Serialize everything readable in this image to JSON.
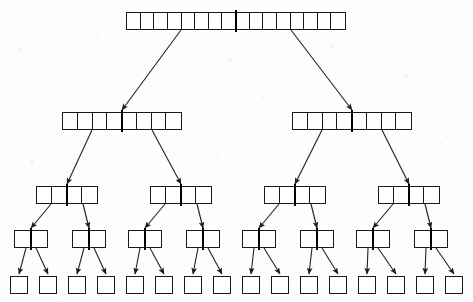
{
  "diagram": {
    "type": "tree-diagram",
    "canvas": {
      "width": 473,
      "height": 302,
      "background": "#fdfdfd"
    },
    "style": {
      "node_fill": "#ffffff",
      "node_stroke": "#1a1a1a",
      "divider_color": "#000000",
      "edge_color": "#222222",
      "edge_width": 1.1,
      "divider_width": 2.6
    },
    "levels": [
      {
        "index": 0,
        "label": "root",
        "cells": 16,
        "node_count": 1,
        "y": 12,
        "height": 18,
        "node_width": 220
      },
      {
        "index": 1,
        "label": "level-1",
        "cells": 8,
        "node_count": 2,
        "y": 112,
        "height": 18,
        "node_width": 120
      },
      {
        "index": 2,
        "label": "level-2",
        "cells": 4,
        "node_count": 4,
        "y": 186,
        "height": 18,
        "node_width": 62
      },
      {
        "index": 3,
        "label": "level-3",
        "cells": 2,
        "node_count": 8,
        "y": 230,
        "height": 18,
        "node_width": 34
      },
      {
        "index": 4,
        "label": "leaves",
        "cells": 1,
        "node_count": 16,
        "y": 276,
        "height": 18,
        "node_width": 18
      }
    ],
    "nodes": [
      {
        "id": "n0",
        "level": 0,
        "cells": 16,
        "x": 126,
        "y": 12,
        "w": 220,
        "h": 18,
        "divider": true
      },
      {
        "id": "n1L",
        "level": 1,
        "cells": 8,
        "x": 62,
        "y": 112,
        "w": 120,
        "h": 18,
        "divider": true
      },
      {
        "id": "n1R",
        "level": 1,
        "cells": 8,
        "x": 292,
        "y": 112,
        "w": 120,
        "h": 18,
        "divider": true
      },
      {
        "id": "n2a",
        "level": 2,
        "cells": 4,
        "x": 36,
        "y": 186,
        "w": 62,
        "h": 18,
        "divider": true
      },
      {
        "id": "n2b",
        "level": 2,
        "cells": 4,
        "x": 150,
        "y": 186,
        "w": 62,
        "h": 18,
        "divider": true
      },
      {
        "id": "n2c",
        "level": 2,
        "cells": 4,
        "x": 264,
        "y": 186,
        "w": 62,
        "h": 18,
        "divider": true
      },
      {
        "id": "n2d",
        "level": 2,
        "cells": 4,
        "x": 378,
        "y": 186,
        "w": 62,
        "h": 18,
        "divider": true
      },
      {
        "id": "n3a",
        "level": 3,
        "cells": 2,
        "x": 14,
        "y": 230,
        "w": 34,
        "h": 18,
        "divider": true
      },
      {
        "id": "n3b",
        "level": 3,
        "cells": 2,
        "x": 72,
        "y": 230,
        "w": 34,
        "h": 18,
        "divider": true
      },
      {
        "id": "n3c",
        "level": 3,
        "cells": 2,
        "x": 128,
        "y": 230,
        "w": 34,
        "h": 18,
        "divider": true
      },
      {
        "id": "n3d",
        "level": 3,
        "cells": 2,
        "x": 186,
        "y": 230,
        "w": 34,
        "h": 18,
        "divider": true
      },
      {
        "id": "n3e",
        "level": 3,
        "cells": 2,
        "x": 242,
        "y": 230,
        "w": 34,
        "h": 18,
        "divider": true
      },
      {
        "id": "n3f",
        "level": 3,
        "cells": 2,
        "x": 300,
        "y": 230,
        "w": 34,
        "h": 18,
        "divider": true
      },
      {
        "id": "n3g",
        "level": 3,
        "cells": 2,
        "x": 356,
        "y": 230,
        "w": 34,
        "h": 18,
        "divider": true
      },
      {
        "id": "n3h",
        "level": 3,
        "cells": 2,
        "x": 414,
        "y": 230,
        "w": 34,
        "h": 18,
        "divider": true
      },
      {
        "id": "l0",
        "level": 4,
        "cells": 1,
        "x": 10,
        "y": 276,
        "w": 18,
        "h": 18,
        "divider": false
      },
      {
        "id": "l1",
        "level": 4,
        "cells": 1,
        "x": 39,
        "y": 276,
        "w": 18,
        "h": 18,
        "divider": false
      },
      {
        "id": "l2",
        "level": 4,
        "cells": 1,
        "x": 68,
        "y": 276,
        "w": 18,
        "h": 18,
        "divider": false
      },
      {
        "id": "l3",
        "level": 4,
        "cells": 1,
        "x": 97,
        "y": 276,
        "w": 18,
        "h": 18,
        "divider": false
      },
      {
        "id": "l4",
        "level": 4,
        "cells": 1,
        "x": 126,
        "y": 276,
        "w": 18,
        "h": 18,
        "divider": false
      },
      {
        "id": "l5",
        "level": 4,
        "cells": 1,
        "x": 155,
        "y": 276,
        "w": 18,
        "h": 18,
        "divider": false
      },
      {
        "id": "l6",
        "level": 4,
        "cells": 1,
        "x": 184,
        "y": 276,
        "w": 18,
        "h": 18,
        "divider": false
      },
      {
        "id": "l7",
        "level": 4,
        "cells": 1,
        "x": 213,
        "y": 276,
        "w": 18,
        "h": 18,
        "divider": false
      },
      {
        "id": "l8",
        "level": 4,
        "cells": 1,
        "x": 242,
        "y": 276,
        "w": 18,
        "h": 18,
        "divider": false
      },
      {
        "id": "l9",
        "level": 4,
        "cells": 1,
        "x": 271,
        "y": 276,
        "w": 18,
        "h": 18,
        "divider": false
      },
      {
        "id": "l10",
        "level": 4,
        "cells": 1,
        "x": 300,
        "y": 276,
        "w": 18,
        "h": 18,
        "divider": false
      },
      {
        "id": "l11",
        "level": 4,
        "cells": 1,
        "x": 329,
        "y": 276,
        "w": 18,
        "h": 18,
        "divider": false
      },
      {
        "id": "l12",
        "level": 4,
        "cells": 1,
        "x": 358,
        "y": 276,
        "w": 18,
        "h": 18,
        "divider": false
      },
      {
        "id": "l13",
        "level": 4,
        "cells": 1,
        "x": 387,
        "y": 276,
        "w": 18,
        "h": 18,
        "divider": false
      },
      {
        "id": "l14",
        "level": 4,
        "cells": 1,
        "x": 416,
        "y": 276,
        "w": 18,
        "h": 18,
        "divider": false
      },
      {
        "id": "l15",
        "level": 4,
        "cells": 1,
        "x": 445,
        "y": 276,
        "w": 18,
        "h": 18,
        "divider": false
      }
    ],
    "edges": [
      {
        "from": "n0",
        "to": "n1L",
        "x1": 181,
        "y1": 30,
        "x2": 122,
        "y2": 110
      },
      {
        "from": "n0",
        "to": "n1R",
        "x1": 291,
        "y1": 30,
        "x2": 352,
        "y2": 110
      },
      {
        "from": "n1L",
        "to": "n2a",
        "x1": 92,
        "y1": 130,
        "x2": 67,
        "y2": 184
      },
      {
        "from": "n1L",
        "to": "n2b",
        "x1": 152,
        "y1": 130,
        "x2": 181,
        "y2": 184
      },
      {
        "from": "n1R",
        "to": "n2c",
        "x1": 322,
        "y1": 130,
        "x2": 295,
        "y2": 184
      },
      {
        "from": "n1R",
        "to": "n2d",
        "x1": 382,
        "y1": 130,
        "x2": 409,
        "y2": 184
      },
      {
        "from": "n2a",
        "to": "n3a",
        "x1": 51,
        "y1": 204,
        "x2": 31,
        "y2": 228
      },
      {
        "from": "n2a",
        "to": "n3b",
        "x1": 83,
        "y1": 204,
        "x2": 89,
        "y2": 228
      },
      {
        "from": "n2b",
        "to": "n3c",
        "x1": 165,
        "y1": 204,
        "x2": 145,
        "y2": 228
      },
      {
        "from": "n2b",
        "to": "n3d",
        "x1": 197,
        "y1": 204,
        "x2": 203,
        "y2": 228
      },
      {
        "from": "n2c",
        "to": "n3e",
        "x1": 279,
        "y1": 204,
        "x2": 259,
        "y2": 228
      },
      {
        "from": "n2c",
        "to": "n3f",
        "x1": 311,
        "y1": 204,
        "x2": 317,
        "y2": 228
      },
      {
        "from": "n2d",
        "to": "n3g",
        "x1": 393,
        "y1": 204,
        "x2": 373,
        "y2": 228
      },
      {
        "from": "n2d",
        "to": "n3h",
        "x1": 425,
        "y1": 204,
        "x2": 431,
        "y2": 228
      },
      {
        "from": "n3a",
        "to": "l0",
        "x1": 26,
        "y1": 248,
        "x2": 19,
        "y2": 274
      },
      {
        "from": "n3a",
        "to": "l1",
        "x1": 36,
        "y1": 248,
        "x2": 48,
        "y2": 274
      },
      {
        "from": "n3b",
        "to": "l2",
        "x1": 84,
        "y1": 248,
        "x2": 77,
        "y2": 274
      },
      {
        "from": "n3b",
        "to": "l3",
        "x1": 94,
        "y1": 248,
        "x2": 106,
        "y2": 274
      },
      {
        "from": "n3c",
        "to": "l4",
        "x1": 140,
        "y1": 248,
        "x2": 135,
        "y2": 274
      },
      {
        "from": "n3c",
        "to": "l5",
        "x1": 150,
        "y1": 248,
        "x2": 164,
        "y2": 274
      },
      {
        "from": "n3d",
        "to": "l6",
        "x1": 198,
        "y1": 248,
        "x2": 193,
        "y2": 274
      },
      {
        "from": "n3d",
        "to": "l7",
        "x1": 208,
        "y1": 248,
        "x2": 222,
        "y2": 274
      },
      {
        "from": "n3e",
        "to": "l8",
        "x1": 254,
        "y1": 248,
        "x2": 251,
        "y2": 274
      },
      {
        "from": "n3e",
        "to": "l9",
        "x1": 264,
        "y1": 248,
        "x2": 280,
        "y2": 274
      },
      {
        "from": "n3f",
        "to": "l10",
        "x1": 312,
        "y1": 248,
        "x2": 309,
        "y2": 274
      },
      {
        "from": "n3f",
        "to": "l11",
        "x1": 322,
        "y1": 248,
        "x2": 338,
        "y2": 274
      },
      {
        "from": "n3g",
        "to": "l12",
        "x1": 368,
        "y1": 248,
        "x2": 367,
        "y2": 274
      },
      {
        "from": "n3g",
        "to": "l13",
        "x1": 378,
        "y1": 248,
        "x2": 396,
        "y2": 274
      },
      {
        "from": "n3h",
        "to": "l14",
        "x1": 426,
        "y1": 248,
        "x2": 425,
        "y2": 274
      },
      {
        "from": "n3h",
        "to": "l15",
        "x1": 436,
        "y1": 248,
        "x2": 454,
        "y2": 274
      }
    ],
    "specks": [
      {
        "x": 18,
        "y": 48,
        "r": 2.0
      },
      {
        "x": 44,
        "y": 62,
        "r": 1.5
      },
      {
        "x": 96,
        "y": 36,
        "r": 1.7
      },
      {
        "x": 150,
        "y": 86,
        "r": 1.4
      },
      {
        "x": 228,
        "y": 58,
        "r": 2.2
      },
      {
        "x": 262,
        "y": 96,
        "r": 1.6
      },
      {
        "x": 330,
        "y": 44,
        "r": 1.8
      },
      {
        "x": 404,
        "y": 74,
        "r": 2.0
      },
      {
        "x": 440,
        "y": 142,
        "r": 1.6
      },
      {
        "x": 30,
        "y": 160,
        "r": 1.9
      },
      {
        "x": 216,
        "y": 156,
        "r": 1.5
      },
      {
        "x": 118,
        "y": 214,
        "r": 1.7
      },
      {
        "x": 348,
        "y": 262,
        "r": 1.5
      },
      {
        "x": 62,
        "y": 294,
        "r": 1.4
      },
      {
        "x": 256,
        "y": 218,
        "r": 1.6
      }
    ]
  }
}
